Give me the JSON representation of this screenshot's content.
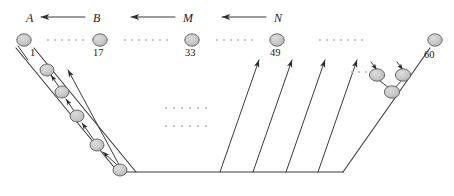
{
  "figure": {
    "type": "network-routing-diagram",
    "background": "#ffffff",
    "stroke_color": "#3a3a3a",
    "node_fill": "#c9c9c9",
    "node_stroke": "#5a5a5a",
    "dot_color": "#b8b8b8",
    "text_color": "#1a1a1a",
    "width": 454,
    "height": 196
  },
  "region_labels": [
    {
      "id": "A",
      "text": "A",
      "x": 26,
      "y": 12
    },
    {
      "id": "B",
      "text": "B",
      "x": 93,
      "y": 12
    },
    {
      "id": "M",
      "text": "M",
      "x": 183,
      "y": 12
    },
    {
      "id": "N",
      "text": "N",
      "x": 274,
      "y": 12
    }
  ],
  "top_arrows": [
    {
      "id": "arrow-B-to-A",
      "from_x": 85,
      "to_x": 41,
      "y": 17
    },
    {
      "id": "arrow-M-to-B",
      "from_x": 175,
      "to_x": 131,
      "y": 17
    },
    {
      "id": "arrow-N-to-M",
      "from_x": 266,
      "to_x": 222,
      "y": 17
    }
  ],
  "top_nodes": [
    {
      "id": "node-1",
      "label": "1",
      "cx": 24,
      "cy": 40,
      "label_x": 30,
      "label_y": 48
    },
    {
      "id": "node-17",
      "label": "17",
      "cx": 100,
      "cy": 40,
      "label_x": 93,
      "label_y": 48
    },
    {
      "id": "node-33",
      "label": "33",
      "cx": 192,
      "cy": 40,
      "label_x": 185,
      "label_y": 48
    },
    {
      "id": "node-49",
      "label": "49",
      "cx": 277,
      "cy": 40,
      "label_x": 270,
      "label_y": 48
    },
    {
      "id": "node-60",
      "label": "60",
      "cx": 435,
      "cy": 40,
      "label_x": 424,
      "label_y": 50
    }
  ],
  "top_dot_groups": [
    {
      "id": "dots-1-17",
      "x": 48,
      "y": 40,
      "count": 6,
      "spacing": 7
    },
    {
      "id": "dots-17-33",
      "x": 125,
      "y": 40,
      "count": 7,
      "spacing": 7
    },
    {
      "id": "dots-33-49",
      "x": 217,
      "y": 40,
      "count": 6,
      "spacing": 7
    },
    {
      "id": "dots-49-60",
      "x": 320,
      "y": 40,
      "count": 7,
      "spacing": 7
    }
  ],
  "middle_dot_groups": [
    {
      "id": "dots-middle-upper",
      "x": 166,
      "y": 108,
      "count": 6,
      "spacing": 8
    },
    {
      "id": "dots-middle-lower",
      "x": 166,
      "y": 126,
      "count": 6,
      "spacing": 8
    }
  ],
  "right_dot_group": {
    "id": "dots-right-inner",
    "x": 352,
    "y": 72,
    "count": 5,
    "spacing": 7
  },
  "frame_lines": [
    {
      "id": "frame-left-outer",
      "x1": 16,
      "y1": 48,
      "x2": 118,
      "y2": 172
    },
    {
      "id": "frame-left-inner",
      "x1": 34,
      "y1": 48,
      "x2": 136,
      "y2": 172
    },
    {
      "id": "frame-baseline",
      "x1": 118,
      "y1": 172,
      "x2": 343,
      "y2": 172
    },
    {
      "id": "frame-right-outer",
      "x1": 343,
      "y1": 172,
      "x2": 430,
      "y2": 48
    }
  ],
  "right_fan_lines": [
    {
      "id": "fan-line-1",
      "x1": 220,
      "y1": 172,
      "x2": 259,
      "y2": 60
    },
    {
      "id": "fan-line-2",
      "x1": 253,
      "y1": 172,
      "x2": 292,
      "y2": 60
    },
    {
      "id": "fan-line-3",
      "x1": 286,
      "y1": 172,
      "x2": 325,
      "y2": 60
    },
    {
      "id": "fan-line-4",
      "x1": 318,
      "y1": 172,
      "x2": 357,
      "y2": 60
    }
  ],
  "left_chain": {
    "id": "left-descending-chain",
    "long_arrow": {
      "x1": 124,
      "y1": 174,
      "x2": 68,
      "y2": 70
    },
    "nodes": [
      {
        "id": "chain-node-1",
        "cx": 47,
        "cy": 70
      },
      {
        "id": "chain-node-2",
        "cx": 62,
        "cy": 92
      },
      {
        "id": "chain-node-3",
        "cx": 77,
        "cy": 116
      },
      {
        "id": "chain-node-4",
        "cx": 97,
        "cy": 145
      },
      {
        "id": "chain-node-5",
        "cx": 120,
        "cy": 170
      }
    ],
    "connectors": [
      {
        "id": "chain-arrow-2-1",
        "x1": 59,
        "y1": 87,
        "x2": 51,
        "y2": 75
      },
      {
        "id": "chain-arrow-3-2",
        "x1": 74,
        "y1": 111,
        "x2": 66,
        "y2": 99
      },
      {
        "id": "chain-arrow-4-3",
        "x1": 94,
        "y1": 140,
        "x2": 82,
        "y2": 123
      },
      {
        "id": "chain-arrow-5-4",
        "x1": 117,
        "y1": 165,
        "x2": 103,
        "y2": 152
      }
    ]
  },
  "right_cluster": {
    "id": "right-node-cluster",
    "nodes": [
      {
        "id": "cluster-node-left",
        "cx": 377,
        "cy": 75
      },
      {
        "id": "cluster-node-right",
        "cx": 403,
        "cy": 75
      },
      {
        "id": "cluster-node-bottom",
        "cx": 392,
        "cy": 92
      }
    ],
    "links": [
      {
        "id": "cluster-link-left",
        "x1": 379,
        "y1": 80,
        "x2": 390,
        "y2": 89
      },
      {
        "id": "cluster-link-right",
        "x1": 402,
        "y1": 80,
        "x2": 394,
        "y2": 89
      }
    ],
    "in_arrows": [
      {
        "id": "cluster-arrow-left",
        "x1": 371,
        "y1": 62,
        "x2": 377,
        "y2": 70
      },
      {
        "id": "cluster-arrow-right",
        "x1": 397,
        "y1": 62,
        "x2": 403,
        "y2": 70
      }
    ]
  },
  "node1_stub": {
    "id": "node-1-stub-line",
    "x1": 18,
    "y1": 46,
    "x2": 28,
    "y2": 60
  }
}
